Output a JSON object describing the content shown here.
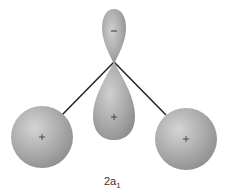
{
  "diagram": {
    "label_main": "2a",
    "label_sub": "1",
    "top_lobe_sign": "−",
    "bottom_lobe_sign": "+",
    "left_atom_sign": "+",
    "right_atom_sign": "+",
    "colors": {
      "lobe_fill": "#a8a8a8",
      "lobe_highlight": "#d8d8d8",
      "bond_line": "#222222"
    }
  }
}
